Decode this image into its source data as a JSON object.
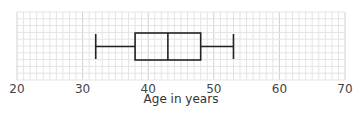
{
  "chart_data": {
    "type": "boxplot",
    "title": "",
    "xlabel": "Age in years",
    "ylabel": "",
    "xlim": [
      20,
      70
    ],
    "x_ticks": [
      20,
      30,
      40,
      50,
      60,
      70
    ],
    "x_tick_labels": [
      "20",
      "30",
      "40",
      "50",
      "60",
      "70"
    ],
    "grid": true,
    "grid_minor_step": 1,
    "grid_major_step": 10,
    "legend": null,
    "series": [
      {
        "name": "Age",
        "min": 32,
        "q1": 38,
        "median": 43,
        "q3": 48,
        "max": 53
      }
    ]
  },
  "colors": {
    "grid_minor": "#e4e4e4",
    "grid_major": "#cfcfcf",
    "box_stroke": "#222222",
    "text": "#444444"
  }
}
